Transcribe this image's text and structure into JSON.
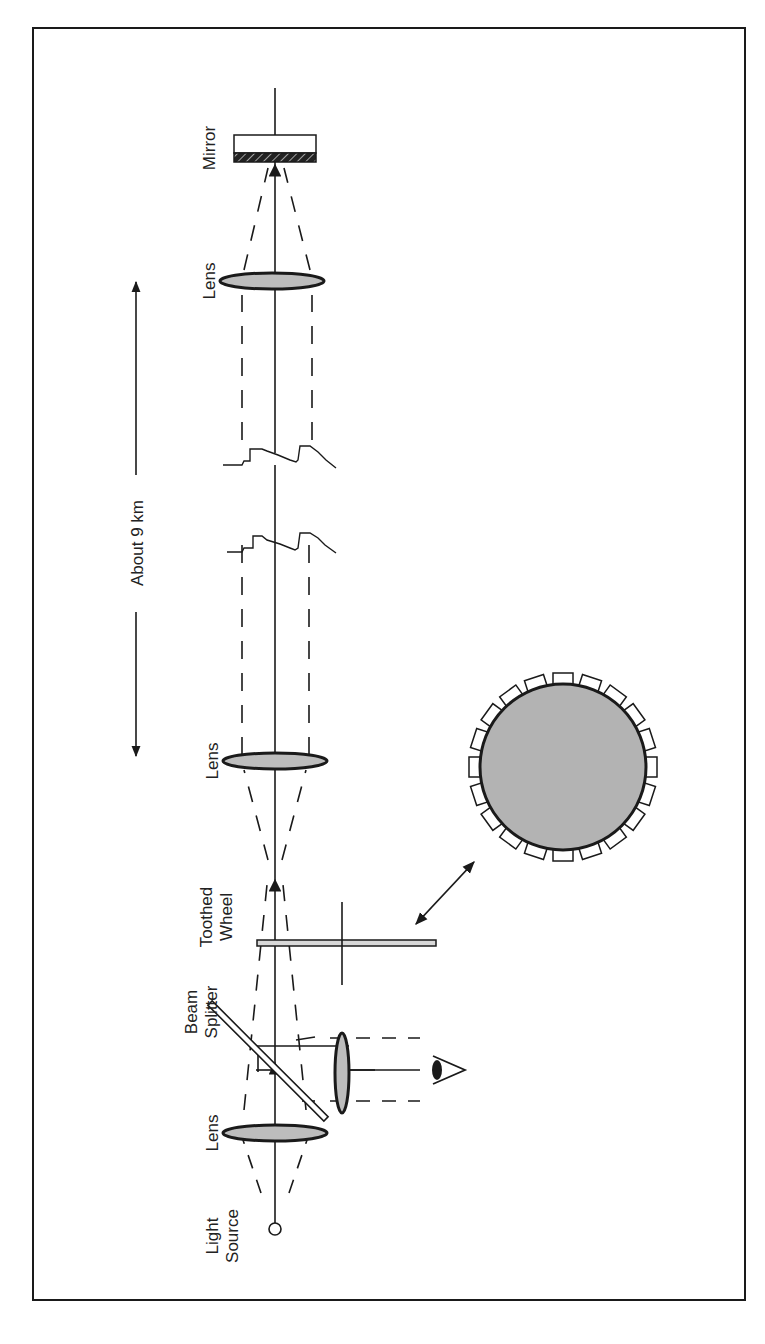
{
  "figure": {
    "orientation": "rotated 90° (beam path runs vertically, labels read bottom-to-top)",
    "colors": {
      "line": "#1a1a1a",
      "lens_fill": "#bdbdbd",
      "wheel_fill": "#b3b3b3",
      "background": "#ffffff"
    }
  },
  "labels": {
    "light_source": [
      "Light",
      "Source"
    ],
    "lens_1": "Lens",
    "beam_splitter": [
      "Beam",
      "Splitter"
    ],
    "toothed_wheel": [
      "Toothed",
      "Wheel"
    ],
    "lens_2": "Lens",
    "distance": "About  9 km",
    "lens_3": "Lens",
    "mirror": "Mirror"
  },
  "components": [
    {
      "id": "light-source",
      "type": "circle"
    },
    {
      "id": "lens-1",
      "type": "lens"
    },
    {
      "id": "beam-splitter",
      "type": "plate"
    },
    {
      "id": "eyepiece-lens",
      "type": "lens"
    },
    {
      "id": "eye",
      "type": "observer"
    },
    {
      "id": "toothed-wheel",
      "type": "wheel",
      "teeth": 20
    },
    {
      "id": "lens-2",
      "type": "lens"
    },
    {
      "id": "terrain-gap",
      "type": "break-line"
    },
    {
      "id": "lens-3",
      "type": "lens"
    },
    {
      "id": "mirror",
      "type": "mirror"
    }
  ]
}
